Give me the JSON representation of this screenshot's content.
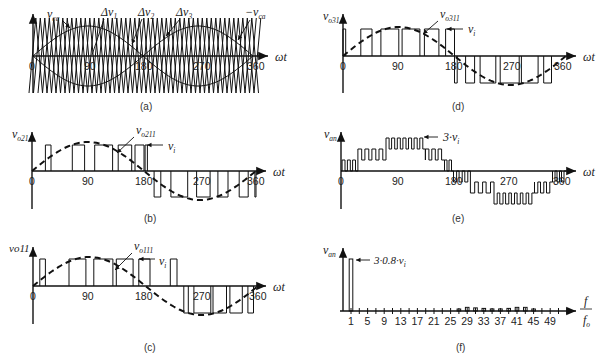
{
  "figure": {
    "panels": [
      {
        "id": "a",
        "caption": "(a)",
        "x_label": "ωt",
        "x_ticks": [
          "0",
          "90",
          "180",
          "270",
          "360"
        ],
        "annotations": [
          "v_ca",
          "Δv_1",
          "Δv_2",
          "Δv_3",
          "−v_ca"
        ],
        "description": "Carrier-based modulation: sinusoidal references v_ca and −v_ca with three level-shifted triangular carriers Δv1, Δv2, Δv3"
      },
      {
        "id": "b",
        "caption": "(b)",
        "y_label": "v_o21",
        "x_label": "ωt",
        "x_ticks": [
          "0",
          "90",
          "180",
          "270",
          "360"
        ],
        "annotations": [
          "v_o211",
          "v_i"
        ],
        "description": "PWM output pulses of cell 2 with fundamental component v_o211 (dashed)"
      },
      {
        "id": "c",
        "caption": "(c)",
        "y_label": "v_o11",
        "x_label": "ωt",
        "x_ticks": [
          "0",
          "90",
          "180",
          "270",
          "360"
        ],
        "annotations": [
          "v_o111",
          "v_i"
        ],
        "description": "PWM output pulses of cell 1 with fundamental component v_o111 (dashed)"
      },
      {
        "id": "d",
        "caption": "(d)",
        "y_label": "v_o31",
        "x_label": "ωt",
        "x_ticks": [
          "0",
          "90",
          "180",
          "270",
          "360"
        ],
        "annotations": [
          "v_o311",
          "v_i"
        ],
        "description": "PWM output pulses of cell 3 with fundamental component v_o311 (dashed)"
      },
      {
        "id": "e",
        "caption": "(e)",
        "y_label": "v_an",
        "x_label": "ωt",
        "x_ticks": [
          "0",
          "90",
          "180",
          "270",
          "360"
        ],
        "annotations": [
          "3·v_i"
        ],
        "description": "Multilevel phase voltage v_an, sum of three cells, peak 3·v_i"
      },
      {
        "id": "f",
        "caption": "(f)",
        "y_label": "v_an",
        "x_label": "f / f_o",
        "x_ticks": [
          "1",
          "5",
          "9",
          "13",
          "17",
          "21",
          "25",
          "29",
          "33",
          "37",
          "41",
          "45",
          "49"
        ],
        "annotations": [
          "3·0.8·v_i"
        ],
        "description": "Harmonic spectrum of v_an: fundamental at 1 with amplitude 3·0.8·v_i, small sidebands around 27–45"
      }
    ]
  },
  "text": {
    "a_vca": "v",
    "a_vca_sub": "ca",
    "a_dv1": "Δv",
    "a_dv1_sub": "1",
    "a_dv2": "Δv",
    "a_dv2_sub": "2",
    "a_dv3": "Δv",
    "a_dv3_sub": "3",
    "a_nvca": "−v",
    "a_nvca_sub": "ca",
    "wt": "ωt",
    "t0": "0",
    "t90": "90",
    "t180": "180",
    "t270": "270",
    "t360": "360",
    "cap_a": "(a)",
    "cap_b": "(b)",
    "cap_c": "(c)",
    "cap_d": "(d)",
    "cap_e": "(e)",
    "cap_f": "(f)",
    "b_y": "v",
    "b_y_sub": "o21",
    "b_fund": "v",
    "b_fund_sub": "o211",
    "vi": "v",
    "vi_sub": "i",
    "c_y": "vo11",
    "c_fund": "v",
    "c_fund_sub": "o111",
    "d_y": "v",
    "d_y_sub": "o31",
    "d_fund": "v",
    "d_fund_sub": "o311",
    "e_y": "v",
    "e_y_sub": "an",
    "e_peak": "3·v",
    "e_peak_sub": "i",
    "f_y": "v",
    "f_y_sub": "an",
    "f_peak": "3·0.8·v",
    "f_peak_sub": "i",
    "f_num": "f",
    "f_den": "f",
    "f_den_sub": "o",
    "f_ticks": [
      "1",
      "5",
      "9",
      "13",
      "17",
      "21",
      "25",
      "29",
      "33",
      "37",
      "41",
      "45",
      "49"
    ]
  },
  "chart_data": [
    {
      "type": "line",
      "title": "(a)",
      "xlabel": "ωt",
      "x_ticks": [
        0,
        90,
        180,
        270,
        360
      ],
      "series": [
        {
          "name": "v_ca",
          "shape": "sinusoid",
          "period_deg": 360
        },
        {
          "name": "−v_ca",
          "shape": "sinusoid",
          "period_deg": 360
        },
        {
          "name": "Δv_1",
          "shape": "triangular carrier"
        },
        {
          "name": "Δv_2",
          "shape": "triangular carrier"
        },
        {
          "name": "Δv_3",
          "shape": "triangular carrier"
        }
      ]
    },
    {
      "type": "line",
      "title": "(b)",
      "ylabel": "v_o21",
      "xlabel": "ωt",
      "x_ticks": [
        0,
        90,
        180,
        270,
        360
      ],
      "series": [
        {
          "name": "v_o21",
          "shape": "bipolar PWM pulses, amplitude v_i"
        },
        {
          "name": "v_o211",
          "shape": "dashed fundamental sinusoid"
        }
      ]
    },
    {
      "type": "line",
      "title": "(c)",
      "ylabel": "v_o11",
      "xlabel": "ωt",
      "x_ticks": [
        0,
        90,
        180,
        270,
        360
      ],
      "series": [
        {
          "name": "v_o11",
          "shape": "bipolar PWM pulses, amplitude v_i"
        },
        {
          "name": "v_o111",
          "shape": "dashed fundamental sinusoid"
        }
      ]
    },
    {
      "type": "line",
      "title": "(d)",
      "ylabel": "v_o31",
      "xlabel": "ωt",
      "x_ticks": [
        0,
        90,
        180,
        270,
        360
      ],
      "series": [
        {
          "name": "v_o31",
          "shape": "bipolar PWM pulses, amplitude v_i"
        },
        {
          "name": "v_o311",
          "shape": "dashed fundamental sinusoid"
        }
      ]
    },
    {
      "type": "line",
      "title": "(e)",
      "ylabel": "v_an",
      "xlabel": "ωt",
      "x_ticks": [
        0,
        90,
        180,
        270,
        360
      ],
      "series": [
        {
          "name": "v_an",
          "shape": "7-level staircase PWM, peak 3·v_i"
        }
      ]
    },
    {
      "type": "bar",
      "title": "(f)",
      "ylabel": "v_an",
      "xlabel": "f/f_o",
      "categories": [
        1,
        5,
        9,
        13,
        17,
        21,
        25,
        29,
        33,
        37,
        41,
        45,
        49
      ],
      "series": [
        {
          "name": "harmonic amplitude (relative, fundamental = 3·0.8·v_i)",
          "x": [
            1,
            27,
            29,
            31,
            33,
            35,
            37,
            39,
            41,
            43,
            45
          ],
          "values": [
            1.0,
            0.03,
            0.07,
            0.06,
            0.05,
            0.04,
            0.04,
            0.05,
            0.07,
            0.07,
            0.03
          ]
        }
      ]
    }
  ]
}
